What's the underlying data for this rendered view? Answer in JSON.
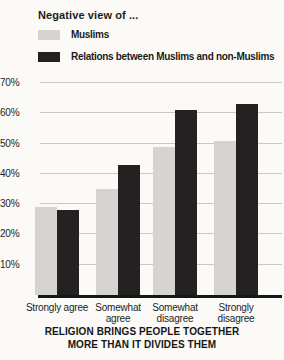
{
  "chart_data": {
    "type": "bar",
    "title": "Negative view of ...",
    "categories": [
      "Strongly agree",
      "Somewhat agree",
      "Somewhat disagree",
      "Strongly disagree"
    ],
    "series": [
      {
        "name": "Muslims",
        "color": "#d5d4d0",
        "values": [
          29,
          35,
          49,
          51
        ]
      },
      {
        "name": "Relations between Muslims and non-Muslims",
        "color": "#232122",
        "values": [
          28,
          43,
          61,
          63
        ]
      }
    ],
    "xlabel": "",
    "ylabel": "",
    "ylim": [
      0,
      70
    ],
    "yticks": [
      10,
      20,
      30,
      40,
      50,
      60,
      70
    ],
    "ytick_suffix": "%",
    "grid": true,
    "legend_position": "top-left",
    "caption_lines": [
      "RELIGION BRINGS PEOPLE TOGETHER",
      "MORE THAN IT DIVIDES THEM"
    ],
    "colors": {
      "background": "#fbfaf7",
      "gridline": "#c9c8c4",
      "axis": "#161616",
      "text": "#1b1b1b"
    },
    "layout": {
      "group_centers_px": [
        19,
        80,
        137,
        198
      ],
      "bar_width_px": 22,
      "plot_height_px": 218,
      "y_scale_max": 72
    }
  }
}
